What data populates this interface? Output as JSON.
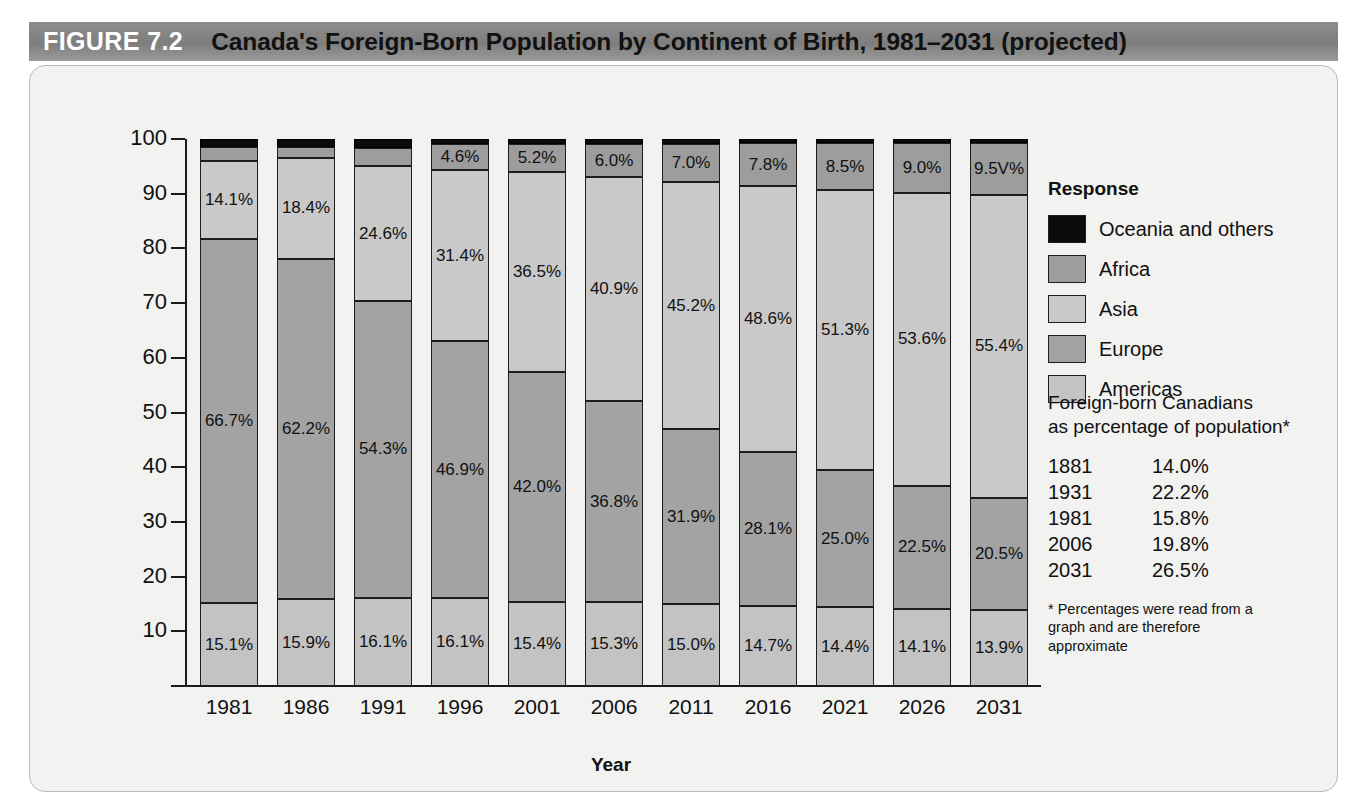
{
  "header": {
    "figure_number": "FIGURE 7.2",
    "title": "Canada's Foreign-Born Population by Continent of Birth, 1981–2031 (projected)"
  },
  "legend": {
    "title": "Response",
    "items": [
      {
        "label": "Oceania and others",
        "color": "#0b0b0b"
      },
      {
        "label": "Africa",
        "color": "#9d9d9d"
      },
      {
        "label": "Asia",
        "color": "#c9c9c9"
      },
      {
        "label": "Europe",
        "color": "#a3a3a3"
      },
      {
        "label": "Americas",
        "color": "#c3c3c3"
      }
    ]
  },
  "stats": {
    "heading_line1": "Foreign-born Canadians",
    "heading_line2": "as percentage of population*",
    "rows": [
      {
        "year": "1881",
        "value": "14.0%"
      },
      {
        "year": "1931",
        "value": "22.2%"
      },
      {
        "year": "1981",
        "value": "15.8%"
      },
      {
        "year": "2006",
        "value": "19.8%"
      },
      {
        "year": "2031",
        "value": "26.5%"
      }
    ],
    "note": "* Percentages were read from a graph and are therefore approximate"
  },
  "chart_data": {
    "type": "bar",
    "subtype": "100% stacked column",
    "title": "Canada's Foreign-Born Population by Continent of Birth, 1981–2031 (projected)",
    "xlabel": "Year",
    "ylabel": "Percentage",
    "ylim": [
      0,
      100
    ],
    "yticks": [
      10,
      20,
      30,
      40,
      50,
      60,
      70,
      80,
      90,
      100
    ],
    "grid": false,
    "legend_position": "right",
    "categories": [
      "1981",
      "1986",
      "1991",
      "1996",
      "2001",
      "2006",
      "2011",
      "2016",
      "2021",
      "2026",
      "2031"
    ],
    "stack_order_bottom_to_top": [
      "Americas",
      "Europe",
      "Asia",
      "Africa",
      "Oceania and others"
    ],
    "series": [
      {
        "name": "Americas",
        "color": "#c3c3c3",
        "values": [
          15.1,
          15.9,
          16.1,
          16.1,
          15.4,
          15.3,
          15.0,
          14.7,
          14.4,
          14.1,
          13.9
        ],
        "labels": [
          "15.1%",
          "15.9%",
          "16.1%",
          "16.1%",
          "15.4%",
          "15.3%",
          "15.0%",
          "14.7%",
          "14.4%",
          "14.1%",
          "13.9%"
        ]
      },
      {
        "name": "Europe",
        "color": "#a3a3a3",
        "values": [
          66.7,
          62.2,
          54.3,
          46.9,
          42.0,
          36.8,
          31.9,
          28.1,
          25.0,
          22.5,
          20.5
        ],
        "labels": [
          "66.7%",
          "62.2%",
          "54.3%",
          "46.9%",
          "42.0%",
          "36.8%",
          "31.9%",
          "28.1%",
          "25.0%",
          "22.5%",
          "20.5%"
        ]
      },
      {
        "name": "Asia",
        "color": "#c9c9c9",
        "values": [
          14.1,
          18.4,
          24.6,
          31.4,
          36.5,
          40.9,
          45.2,
          48.6,
          51.3,
          53.6,
          55.4
        ],
        "labels": [
          "14.1%",
          "18.4%",
          "24.6%",
          "31.4%",
          "36.5%",
          "40.9%",
          "45.2%",
          "48.6%",
          "51.3%",
          "53.6%",
          "55.4%"
        ]
      },
      {
        "name": "Africa",
        "color": "#9d9d9d",
        "values": [
          2.6,
          2.0,
          3.3,
          4.6,
          5.2,
          6.0,
          7.0,
          7.8,
          8.5,
          9.0,
          9.5
        ],
        "labels": [
          "",
          "",
          "",
          "4.6%",
          "5.2%",
          "6.0%",
          "7.0%",
          "7.8%",
          "8.5%",
          "9.0%",
          "9.5V%"
        ]
      },
      {
        "name": "Oceania and others",
        "color": "#0b0b0b",
        "values": [
          1.5,
          1.5,
          1.7,
          1.0,
          0.9,
          1.0,
          0.9,
          0.8,
          0.8,
          0.8,
          0.7
        ],
        "labels": [
          "",
          "",
          "",
          "",
          "",
          "",
          "",
          "",
          "",
          "",
          ""
        ]
      }
    ]
  }
}
